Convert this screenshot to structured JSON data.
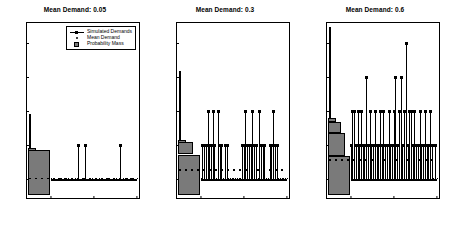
{
  "figure": {
    "width": 450,
    "height": 233,
    "background": "#ffffff",
    "series_color": "#000000",
    "pm_fill_color": "#7a7a7a"
  },
  "legend": {
    "position": "top-right of first panel",
    "entries": [
      {
        "label": "Simulated Demands",
        "marker": "line-with-square"
      },
      {
        "label": "Mean Demand",
        "marker": "dot"
      },
      {
        "label": "Probability Mass",
        "marker": "filled-square"
      }
    ]
  },
  "chart_data": [
    {
      "type": "line",
      "title": "Mean Demand: 0.05",
      "xlabel": "",
      "ylabel": "",
      "xlim": [
        -55,
        205
      ],
      "ylim": [
        -0.55,
        4.6
      ],
      "xticks": [
        0,
        100,
        200
      ],
      "yticks": [
        0,
        1,
        2,
        3,
        4
      ],
      "grid": false,
      "mean_demand": 0.05,
      "mean_line_y": 0.05,
      "series": [
        {
          "name": "Simulated Demands",
          "x": [
            0,
            8,
            16,
            24,
            32,
            40,
            48,
            56,
            64,
            72,
            80,
            88,
            96,
            104,
            112,
            120,
            128,
            136,
            144,
            152,
            160,
            168,
            176,
            184,
            192,
            200
          ],
          "values": [
            0,
            0,
            0,
            0,
            0,
            0,
            0,
            0,
            1,
            0,
            1,
            0,
            0,
            0,
            0,
            0,
            0,
            0,
            0,
            0,
            1,
            0,
            0,
            0,
            0,
            0
          ]
        }
      ],
      "probability_mass": {
        "orientation": "horizontal-left",
        "bars": [
          {
            "value": 0,
            "mass": 0.95,
            "height_units": 1.0
          },
          {
            "value": 1,
            "mass": 0.05,
            "height_units": 0.05
          }
        ],
        "max_extent": 1.5
      }
    },
    {
      "type": "line",
      "title": "Mean Demand: 0.3",
      "xlabel": "",
      "ylabel": "",
      "xlim": [
        -55,
        205
      ],
      "ylim": [
        -0.55,
        4.6
      ],
      "xticks": [
        0,
        100,
        200
      ],
      "yticks": [
        0,
        1,
        2,
        3,
        4
      ],
      "grid": false,
      "mean_demand": 0.3,
      "mean_line_y": 0.3,
      "series": [
        {
          "name": "Simulated Demands",
          "x": [
            0,
            4,
            8,
            12,
            16,
            20,
            24,
            28,
            32,
            36,
            40,
            44,
            48,
            52,
            56,
            60,
            64,
            68,
            72,
            76,
            80,
            84,
            88,
            92,
            96,
            100,
            104,
            108,
            112,
            116,
            120,
            124,
            128,
            132,
            136,
            140,
            144,
            148,
            152,
            156,
            160,
            164,
            168,
            172,
            176,
            180,
            184,
            188,
            192,
            196,
            200
          ],
          "values": [
            0,
            1,
            1,
            1,
            2,
            1,
            1,
            2,
            1,
            0,
            2,
            1,
            1,
            0,
            1,
            1,
            0,
            0,
            0,
            0,
            0,
            0,
            0,
            0,
            1,
            1,
            2,
            1,
            1,
            1,
            2,
            1,
            1,
            0,
            2,
            1,
            1,
            1,
            0,
            0,
            1,
            1,
            2,
            1,
            1,
            0,
            0,
            0,
            0,
            0,
            0
          ]
        }
      ],
      "probability_mass": {
        "orientation": "horizontal-left",
        "bars": [
          {
            "value": 0,
            "mass": 0.74,
            "height_units": 1.0
          },
          {
            "value": 1,
            "mass": 0.22,
            "height_units": 0.3
          },
          {
            "value": 2,
            "mass": 0.03,
            "height_units": 0.05
          }
        ],
        "max_extent": 2.5
      }
    },
    {
      "type": "line",
      "title": "Mean Demand: 0.6",
      "xlabel": "",
      "ylabel": "",
      "xlim": [
        -55,
        205
      ],
      "ylim": [
        -0.55,
        4.6
      ],
      "xticks": [
        0,
        100,
        200
      ],
      "yticks": [
        0,
        1,
        2,
        3,
        4
      ],
      "grid": false,
      "mean_demand": 0.6,
      "mean_line_y": 0.6,
      "series": [
        {
          "name": "Simulated Demands",
          "x": [
            0,
            4,
            8,
            12,
            16,
            20,
            24,
            28,
            32,
            36,
            40,
            44,
            48,
            52,
            56,
            60,
            64,
            68,
            72,
            76,
            80,
            84,
            88,
            92,
            96,
            100,
            104,
            108,
            112,
            116,
            120,
            124,
            128,
            132,
            136,
            140,
            144,
            148,
            152,
            156,
            160,
            164,
            168,
            172,
            176,
            180,
            184,
            188,
            192,
            196,
            200
          ],
          "values": [
            1,
            2,
            2,
            1,
            2,
            1,
            2,
            1,
            1,
            3,
            1,
            2,
            1,
            1,
            2,
            1,
            1,
            2,
            1,
            2,
            1,
            1,
            2,
            1,
            1,
            2,
            3,
            1,
            2,
            3,
            1,
            2,
            4,
            1,
            2,
            2,
            1,
            2,
            1,
            1,
            2,
            1,
            1,
            2,
            1,
            1,
            2,
            1,
            0,
            1,
            0
          ]
        }
      ],
      "probability_mass": {
        "orientation": "horizontal-left",
        "bars": [
          {
            "value": 0,
            "mass": 0.55,
            "height_units": 1.0
          },
          {
            "value": 1,
            "mass": 0.33,
            "height_units": 0.6
          },
          {
            "value": 2,
            "mass": 0.1,
            "height_units": 0.3
          },
          {
            "value": 3,
            "mass": 0.02,
            "height_units": 0.1
          }
        ],
        "max_extent": 3.5
      }
    }
  ]
}
